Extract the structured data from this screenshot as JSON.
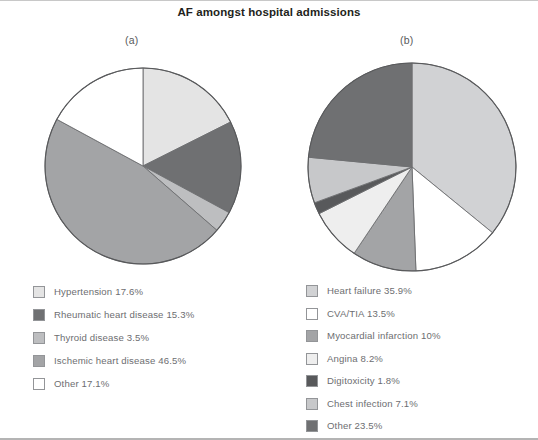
{
  "figure": {
    "title": "AF amongst hospital admissions",
    "panel_a_label": "(a)",
    "panel_b_label": "(b)"
  },
  "colors": {
    "outline": "#58595b",
    "slice_border": "#6d6e71",
    "text": "#6d6e71",
    "title_text": "#231f20",
    "background": "#ffffff"
  },
  "chart_data": [
    {
      "type": "pie",
      "panel": "(a)",
      "title": "AF amongst hospital admissions",
      "start_angle_deg": 90,
      "direction": "clockwise",
      "legend_position": "below",
      "categories": [
        "Hypertension",
        "Rheumatic heart disease",
        "Thyroid disease",
        "Ischemic heart disease",
        "Other"
      ],
      "values": [
        17.6,
        15.3,
        3.5,
        46.5,
        17.1
      ],
      "value_unit": "%",
      "labels": [
        "Hypertension 17.6%",
        "Rheumatic heart disease 15.3%",
        "Thyroid disease 3.5%",
        "Ischemic heart disease 46.5%",
        "Other 17.1%"
      ],
      "slice_colors": [
        "#e4e4e4",
        "#6f7072",
        "#bdbec0",
        "#a3a4a6",
        "#ffffff"
      ]
    },
    {
      "type": "pie",
      "panel": "(b)",
      "title": "AF amongst hospital admissions",
      "start_angle_deg": 90,
      "direction": "clockwise",
      "legend_position": "below",
      "categories": [
        "Heart failure",
        "CVA/TIA",
        "Myocardial infarction",
        "Angina",
        "Digitoxicity",
        "Chest infection",
        "Other"
      ],
      "values": [
        35.9,
        13.5,
        10,
        8.2,
        1.8,
        7.1,
        23.5
      ],
      "value_unit": "%",
      "labels": [
        "Heart failure 35.9%",
        "CVA/TIA 13.5%",
        "Myocardial infarction 10%",
        "Angina 8.2%",
        "Digitoxicity 1.8%",
        "Chest infection 7.1%",
        "Other 23.5%"
      ],
      "slice_colors": [
        "#d1d2d4",
        "#ffffff",
        "#a3a4a6",
        "#eeeeee",
        "#58595b",
        "#c7c8ca",
        "#6f7072"
      ]
    }
  ]
}
